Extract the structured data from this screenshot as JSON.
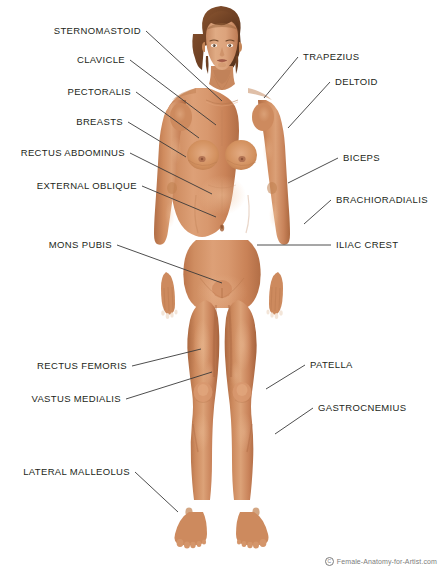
{
  "diagram": {
    "background_color": "#ffffff",
    "label_color": "#231f20",
    "leader_line_color": "#3a3a3a",
    "skin_color": "#cd8a5e",
    "hair_color": "#7b4a2b"
  },
  "labels_left": [
    {
      "id": "sternomastoid",
      "text": "STERNOMASTOID",
      "x": 141,
      "y": 31,
      "line_to_x": 222,
      "line_to_y": 101
    },
    {
      "id": "clavicle",
      "text": "CLAVICLE",
      "x": 125,
      "y": 60,
      "line_to_x": 216,
      "line_to_y": 125
    },
    {
      "id": "pectoralis",
      "text": "PECTORALIS",
      "x": 131,
      "y": 92,
      "line_to_x": 199,
      "line_to_y": 138
    },
    {
      "id": "breasts",
      "text": "BREASTS",
      "x": 123,
      "y": 122,
      "line_to_x": 186,
      "line_to_y": 157
    },
    {
      "id": "rectus-abdominus",
      "text": "RECTUS ABDOMINUS",
      "x": 125,
      "y": 153,
      "line_to_x": 212,
      "line_to_y": 194
    },
    {
      "id": "external-oblique",
      "text": "EXTERNAL OBLIQUE",
      "x": 137,
      "y": 186,
      "line_to_x": 216,
      "line_to_y": 217
    },
    {
      "id": "mons-pubis",
      "text": "MONS PUBIS",
      "x": 112,
      "y": 245,
      "line_to_x": 222,
      "line_to_y": 283
    },
    {
      "id": "rectus-femoris",
      "text": "RECTUS FEMORIS",
      "x": 127,
      "y": 366,
      "line_to_x": 201,
      "line_to_y": 349
    },
    {
      "id": "vastus-medialis",
      "text": "VASTUS MEDIALIS",
      "x": 121,
      "y": 399,
      "line_to_x": 212,
      "line_to_y": 372
    },
    {
      "id": "lateral-malleolus",
      "text": "LATERAL MALLEOLUS",
      "x": 130,
      "y": 472,
      "line_to_x": 178,
      "line_to_y": 512
    }
  ],
  "labels_right": [
    {
      "id": "trapezius",
      "text": "TRAPEZIUS",
      "x": 303,
      "y": 57,
      "line_to_x": 264,
      "line_to_y": 98
    },
    {
      "id": "deltoid",
      "text": "DELTOID",
      "x": 335,
      "y": 82,
      "line_to_x": 288,
      "line_to_y": 128
    },
    {
      "id": "biceps",
      "text": "BICEPS",
      "x": 343,
      "y": 158,
      "line_to_x": 288,
      "line_to_y": 183
    },
    {
      "id": "brachioradialis",
      "text": "BRACHIORADIALIS",
      "x": 336,
      "y": 200,
      "line_to_x": 304,
      "line_to_y": 224
    },
    {
      "id": "iliac-crest",
      "text": "ILIAC CREST",
      "x": 336,
      "y": 245,
      "line_to_x": 257,
      "line_to_y": 245
    },
    {
      "id": "patella",
      "text": "PATELLA",
      "x": 310,
      "y": 365,
      "line_to_x": 266,
      "line_to_y": 389
    },
    {
      "id": "gastrocnemius",
      "text": "GASTROCNEMIUS",
      "x": 318,
      "y": 408,
      "line_to_x": 275,
      "line_to_y": 434
    }
  ],
  "copyright": {
    "mark": "C",
    "text": "Female-Anatomy-for-Artist.com"
  }
}
